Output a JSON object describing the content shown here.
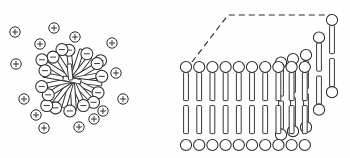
{
  "figure": {
    "background_color": "#fefefe",
    "ink_color": "#2b2b2b",
    "panels": [
      {
        "id": "micelle",
        "name": "micelle-panel",
        "label": "",
        "center": {
          "x": 72,
          "y": 80
        },
        "core_radius": 10,
        "head_ring_radius": 40,
        "counterion_ring_radius": 62,
        "head_charge_symbol": "−",
        "counterion_charge_symbol": "+",
        "head_radius": 6.0,
        "counterion_radius": 5.2,
        "amphiphile_count": 17,
        "counterion_count": 14,
        "amphiphiles": [
          {
            "angle": 264,
            "len": 30,
            "width": 4.6
          },
          {
            "angle": 288,
            "len": 32,
            "width": 4.6
          },
          {
            "angle": 308,
            "len": 29,
            "width": 4.6
          },
          {
            "angle": 329,
            "len": 31,
            "width": 4.6
          },
          {
            "angle": 350,
            "len": 27,
            "width": 4.6
          },
          {
            "angle": 7,
            "len": 30,
            "width": 4.6
          },
          {
            "angle": 26,
            "len": 29,
            "width": 4.6
          },
          {
            "angle": 46,
            "len": 31,
            "width": 4.6
          },
          {
            "angle": 66,
            "len": 28,
            "width": 4.6
          },
          {
            "angle": 86,
            "len": 31,
            "width": 4.6
          },
          {
            "angle": 106,
            "len": 29,
            "width": 4.6
          },
          {
            "angle": 127,
            "len": 32,
            "width": 4.6
          },
          {
            "angle": 148,
            "len": 28,
            "width": 4.6
          },
          {
            "angle": 168,
            "len": 31,
            "width": 4.6
          },
          {
            "angle": 190,
            "len": 29,
            "width": 4.6
          },
          {
            "angle": 212,
            "len": 31,
            "width": 4.6
          },
          {
            "angle": 238,
            "len": 28,
            "width": 4.6
          }
        ],
        "counterions": [
          {
            "x": 15,
            "y": 32
          },
          {
            "x": 54,
            "y": 28
          },
          {
            "x": 75,
            "y": 37
          },
          {
            "x": 112,
            "y": 43
          },
          {
            "x": 16,
            "y": 64
          },
          {
            "x": 116,
            "y": 73
          },
          {
            "x": 24,
            "y": 99
          },
          {
            "x": 123,
            "y": 99
          },
          {
            "x": 103,
            "y": 111
          },
          {
            "x": 44,
            "y": 128
          },
          {
            "x": 79,
            "y": 127
          },
          {
            "x": 40,
            "y": 44
          },
          {
            "x": 36,
            "y": 115
          },
          {
            "x": 94,
            "y": 119
          }
        ]
      },
      {
        "id": "bilayer",
        "name": "bilayer-panel",
        "label": "",
        "front_row_count": 10,
        "depth_row_count": 5,
        "front_left_x": 186,
        "front_top_y": 67,
        "front_bottom_y": 145,
        "column_spacing": 13.2,
        "depth_step_x": 13.0,
        "depth_step_y": -17.5,
        "head_radius": 5.6,
        "tail_length": 28,
        "tail_width": 4.8,
        "dashed_top_edge": "polyline",
        "dashed_points": "192,62 228,15 332,15",
        "back_top_y": 15
      }
    ]
  },
  "legend": {
    "head_group_note": "",
    "counterion_note": "",
    "items": []
  }
}
